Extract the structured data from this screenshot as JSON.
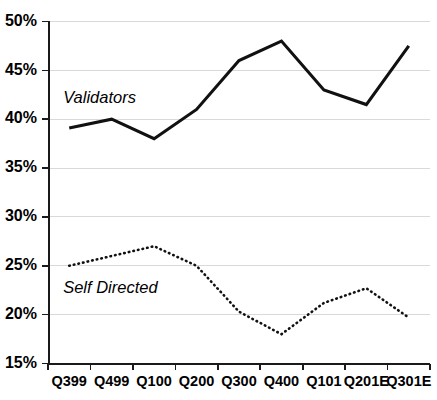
{
  "chart_data": {
    "type": "line",
    "title": "",
    "subtitle": "",
    "xlabel": "",
    "ylabel": "",
    "ylim": [
      15,
      50
    ],
    "ytick_labels": [
      "50%",
      "45%",
      "40%",
      "35%",
      "30%",
      "25%",
      "20%",
      "15%"
    ],
    "ytick_values": [
      50,
      45,
      40,
      35,
      30,
      25,
      20,
      15
    ],
    "grid": true,
    "grid_axis": "y",
    "legend_position": "inline-annotation",
    "categories": [
      "Q399",
      "Q499",
      "Q100",
      "Q200",
      "Q300",
      "Q400",
      "Q101",
      "Q201E",
      "Q301E"
    ],
    "series": [
      {
        "name": "Validators",
        "style": "solid",
        "color": "#111111",
        "values": [
          39.1,
          40.0,
          38.0,
          41.0,
          46.0,
          48.0,
          43.0,
          41.5,
          47.5
        ],
        "annotation": {
          "text": "Validators",
          "x_category": "Q399",
          "y_value": 42.1
        }
      },
      {
        "name": "Self Directed",
        "style": "dotted",
        "color": "#111111",
        "values": [
          25.0,
          26.0,
          27.0,
          25.0,
          20.3,
          18.0,
          21.2,
          22.7,
          19.7
        ],
        "annotation": {
          "text": "Self Directed",
          "x_category": "Q399",
          "y_value": 22.7
        }
      }
    ]
  },
  "axes": {
    "y_axis_name": "percentage-axis",
    "x_axis_name": "quarter-axis"
  }
}
